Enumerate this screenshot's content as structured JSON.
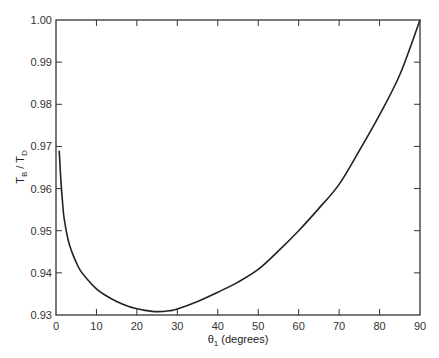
{
  "chart_data": {
    "type": "line",
    "title": "",
    "xlabel": "θ1 (degrees)",
    "xlabel_parts": {
      "main": "θ",
      "sub": "1",
      "rest": " (degrees)"
    },
    "ylabel": "TB / TD",
    "ylabel_parts": {
      "t1": "T",
      "s1": "B",
      "mid": " / ",
      "t2": "T",
      "s2": "D"
    },
    "xlim": [
      0,
      90
    ],
    "ylim": [
      0.93,
      1.0
    ],
    "xticks": [
      0,
      10,
      20,
      30,
      40,
      50,
      60,
      70,
      80,
      90
    ],
    "xtick_labels": [
      "0",
      "10",
      "20",
      "30",
      "40",
      "50",
      "60",
      "70",
      "80",
      "90"
    ],
    "yticks": [
      0.93,
      0.94,
      0.95,
      0.96,
      0.97,
      0.98,
      0.99,
      1.0
    ],
    "ytick_labels": [
      "0.93",
      "0.94",
      "0.95",
      "0.96",
      "0.97",
      "0.98",
      "0.99",
      "1.00"
    ],
    "grid": false,
    "legend": null,
    "series": [
      {
        "name": "TB/TD",
        "color": "#222222",
        "x": [
          0.8,
          1.2,
          1.6,
          2,
          3,
          4,
          5,
          6,
          8,
          10,
          12,
          15,
          18,
          20,
          22,
          25,
          28,
          30,
          35,
          40,
          45,
          50,
          55,
          60,
          65,
          70,
          75,
          80,
          85,
          90
        ],
        "y": [
          0.969,
          0.962,
          0.957,
          0.953,
          0.9478,
          0.9448,
          0.9425,
          0.9406,
          0.9382,
          0.9362,
          0.9348,
          0.9332,
          0.932,
          0.9315,
          0.9311,
          0.9308,
          0.931,
          0.9314,
          0.9332,
          0.9354,
          0.9378,
          0.9408,
          0.9452,
          0.95,
          0.9553,
          0.961,
          0.969,
          0.9775,
          0.987,
          1.0
        ]
      }
    ]
  }
}
